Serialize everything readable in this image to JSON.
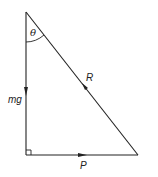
{
  "diagram": {
    "type": "force-triangle",
    "colors": {
      "line": "#222222",
      "background": "#ffffff"
    },
    "vertices": {
      "top": [
        26,
        12
      ],
      "bottom_left": [
        26,
        155
      ],
      "bottom_right": [
        138,
        155
      ]
    },
    "labels": {
      "angle": "θ",
      "weight": "mg",
      "reaction": "R",
      "force": "P"
    },
    "arrows": {
      "weight": "down",
      "reaction": "up-left",
      "force": "right"
    },
    "right_angle_marker": "bottom_left"
  }
}
